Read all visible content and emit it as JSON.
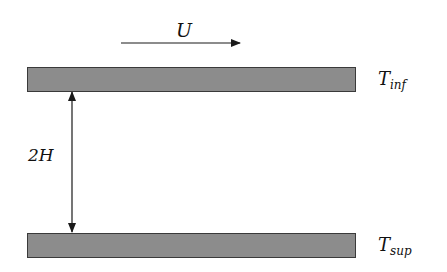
{
  "diagram": {
    "type": "channel-flow-schematic",
    "velocity_label": "U",
    "gap_label": "2H",
    "top_plate": {
      "label_base": "T",
      "label_sub": "inf"
    },
    "bottom_plate": {
      "label_base": "T",
      "label_sub": "sup"
    },
    "colors": {
      "plate_fill": "#8c8c8c",
      "plate_border": "#3a3a3a",
      "lines": "#1a1a1a",
      "background": "#ffffff"
    }
  }
}
